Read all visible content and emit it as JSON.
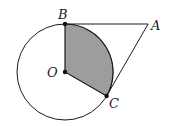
{
  "diagram": {
    "type": "geometry",
    "colors": {
      "stroke": "#1a1a1a",
      "sector_fill": "#9d9d9d",
      "background": "#ffffff"
    },
    "points": {
      "O": {
        "label": "O",
        "x": 65,
        "y": 72
      },
      "B": {
        "label": "B",
        "x": 65,
        "y": 24
      },
      "C": {
        "label": "C",
        "x": 106.6,
        "y": 96
      },
      "A": {
        "label": "A",
        "x": 148.1,
        "y": 24
      }
    },
    "circle": {
      "center": "O",
      "radius": 48
    },
    "shaded_region": "sector BOC",
    "segments": [
      "AB",
      "AC",
      "OB",
      "OC"
    ],
    "labels": {
      "A": "A",
      "B": "B",
      "C": "C",
      "O": "O"
    }
  }
}
